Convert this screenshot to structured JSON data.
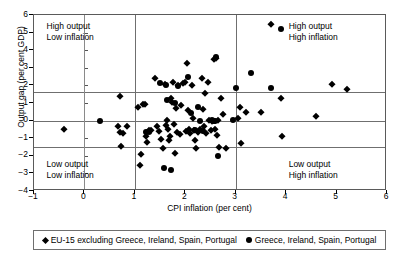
{
  "chart_data": {
    "type": "scatter",
    "title": "",
    "xlabel": "CPI inflation (per cent)",
    "ylabel": "Output gap (per cent GDP)",
    "xlim": [
      -1,
      6
    ],
    "ylim": [
      -4,
      6
    ],
    "xticks": [
      -1,
      0,
      1,
      2,
      3,
      4,
      5,
      6
    ],
    "xtick_labels": [
      "−1",
      "0",
      "1",
      "2",
      "3",
      "4",
      "5",
      "6"
    ],
    "yticks": [
      -4,
      -3,
      -2,
      -1,
      0,
      1,
      2,
      3,
      4,
      5,
      6
    ],
    "ytick_labels": [
      "−4",
      "−3",
      "−2",
      "−1",
      "0",
      "1",
      "2",
      "3",
      "4",
      "5",
      "6"
    ],
    "grid": false,
    "reference_lines": {
      "horizontal": [
        1.6,
        0,
        -1.5
      ],
      "vertical": [
        0,
        1,
        3
      ]
    },
    "legend_position": "below-plot",
    "annotations": [
      {
        "name": "top-left",
        "lines": [
          "High output",
          "Low inflation"
        ],
        "x": -0.75,
        "y": 5.3
      },
      {
        "name": "top-right",
        "lines": [
          "High output",
          "High inflation"
        ],
        "x": 4.05,
        "y": 5.3
      },
      {
        "name": "bottom-left",
        "lines": [
          "Low output",
          "Low inflation"
        ],
        "x": -0.75,
        "y": -2.5
      },
      {
        "name": "bottom-right",
        "lines": [
          "Low output",
          "High inflation"
        ],
        "x": 4.05,
        "y": -2.5
      }
    ],
    "series": [
      {
        "name": "EU-15 excluding Greece, Ireland, Spain, Portugal",
        "marker": "diamond",
        "color": "#000000",
        "points": [
          [
            -0.4,
            -0.45
          ],
          [
            0.7,
            1.4
          ],
          [
            0.66,
            -0.28
          ],
          [
            0.72,
            -1.45
          ],
          [
            0.7,
            -0.62
          ],
          [
            0.76,
            -0.68
          ],
          [
            0.84,
            -0.32
          ],
          [
            1.07,
            0.78
          ],
          [
            1.1,
            -2.5
          ],
          [
            1.12,
            -1.9
          ],
          [
            1.16,
            0.95
          ],
          [
            1.2,
            0.92
          ],
          [
            1.22,
            -0.85
          ],
          [
            1.24,
            -1.2
          ],
          [
            1.28,
            -0.52
          ],
          [
            1.33,
            -0.55
          ],
          [
            1.4,
            2.4
          ],
          [
            1.44,
            -0.3
          ],
          [
            1.48,
            -0.58
          ],
          [
            1.52,
            -1.05
          ],
          [
            1.56,
            -1.58
          ],
          [
            1.6,
            2.1
          ],
          [
            1.62,
            -0.25
          ],
          [
            1.64,
            0.05
          ],
          [
            1.66,
            -0.45
          ],
          [
            1.68,
            -1.12
          ],
          [
            1.7,
            -0.88
          ],
          [
            1.72,
            1.28
          ],
          [
            1.74,
            1.05
          ],
          [
            1.76,
            2.18
          ],
          [
            1.78,
            -0.2
          ],
          [
            1.8,
            -1.85
          ],
          [
            1.82,
            0.72
          ],
          [
            1.84,
            -0.62
          ],
          [
            1.86,
            2.05
          ],
          [
            1.9,
            -0.75
          ],
          [
            1.92,
            0.88
          ],
          [
            1.96,
            2.12
          ],
          [
            2.0,
            2.2
          ],
          [
            2.02,
            -0.58
          ],
          [
            2.04,
            3.3
          ],
          [
            2.06,
            0.62
          ],
          [
            2.08,
            -0.48
          ],
          [
            2.1,
            -0.72
          ],
          [
            2.14,
            2.02
          ],
          [
            2.16,
            0.15
          ],
          [
            2.18,
            -0.55
          ],
          [
            2.2,
            -1.1
          ],
          [
            2.22,
            -1.55
          ],
          [
            2.26,
            -0.62
          ],
          [
            2.3,
            -0.45
          ],
          [
            2.34,
            2.4
          ],
          [
            2.36,
            0.68
          ],
          [
            2.38,
            -0.3
          ],
          [
            2.4,
            1.58
          ],
          [
            2.42,
            -0.68
          ],
          [
            2.46,
            2.18
          ],
          [
            2.48,
            0.02
          ],
          [
            2.5,
            -0.52
          ],
          [
            2.52,
            0.0
          ],
          [
            2.56,
            3.52
          ],
          [
            2.58,
            -0.48
          ],
          [
            2.6,
            3.58
          ],
          [
            2.62,
            -0.8
          ],
          [
            2.64,
            0.05
          ],
          [
            2.66,
            -1.52
          ],
          [
            2.7,
            1.3
          ],
          [
            2.74,
            0.38
          ],
          [
            2.8,
            -1.58
          ],
          [
            3.05,
            0.12
          ],
          [
            3.08,
            0.78
          ],
          [
            3.1,
            -1.3
          ],
          [
            3.2,
            0.5
          ],
          [
            3.5,
            0.48
          ],
          [
            3.7,
            5.5
          ],
          [
            3.9,
            1.3
          ],
          [
            3.92,
            -0.9
          ],
          [
            4.6,
            0.28
          ],
          [
            4.9,
            2.08
          ],
          [
            5.2,
            1.8
          ]
        ]
      },
      {
        "name": "Greece, Ireland, Spain, Portugal",
        "marker": "circle",
        "color": "#000000",
        "points": [
          [
            0.3,
            0.0
          ],
          [
            1.22,
            -0.62
          ],
          [
            1.28,
            -0.62
          ],
          [
            1.5,
            2.12
          ],
          [
            1.58,
            -2.7
          ],
          [
            1.62,
            2.05
          ],
          [
            1.64,
            1.18
          ],
          [
            1.72,
            -2.8
          ],
          [
            1.8,
            0.98
          ],
          [
            1.86,
            1.95
          ],
          [
            2.06,
            2.48
          ],
          [
            2.12,
            0.45
          ],
          [
            2.2,
            -0.55
          ],
          [
            2.26,
            0.78
          ],
          [
            2.3,
            0.0
          ],
          [
            2.36,
            -0.6
          ],
          [
            2.52,
            0.02
          ],
          [
            2.56,
            0.0
          ],
          [
            2.58,
            -0.02
          ],
          [
            2.6,
            3.62
          ],
          [
            2.64,
            -2.02
          ],
          [
            2.94,
            0.02
          ],
          [
            3.0,
            1.88
          ],
          [
            3.3,
            2.7
          ],
          [
            3.7,
            1.88
          ],
          [
            3.9,
            5.2
          ]
        ]
      }
    ]
  },
  "legend": {
    "entries": [
      {
        "label": "EU-15 excluding Greece, Ireland, Spain, Portugal",
        "marker": "diamond-marker"
      },
      {
        "label": "Greece, Ireland, Spain, Portugal",
        "marker": "circle-marker"
      }
    ]
  }
}
